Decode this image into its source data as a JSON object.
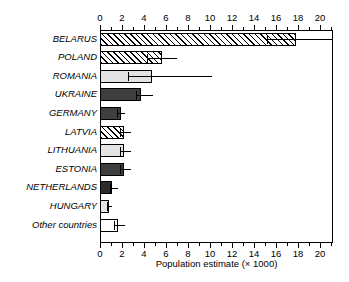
{
  "chart_data": {
    "type": "bar",
    "orientation": "horizontal",
    "title": "",
    "xlabel": "Population estimate (× 1000)",
    "ylabel": "",
    "xlim": [
      0,
      21.2
    ],
    "xticks": [
      0,
      2,
      4,
      6,
      8,
      10,
      12,
      14,
      16,
      18,
      20
    ],
    "xticklabels": [
      "0",
      "2",
      "4",
      "6",
      "8",
      "10",
      "12",
      "14",
      "16",
      "18",
      "20"
    ],
    "minor_tick_step": 1,
    "grid": false,
    "legend": null,
    "axis_top": true,
    "axis_bottom": true,
    "categories": [
      "BELARUS",
      "POLAND",
      "ROMANIA",
      "UKRAINE",
      "GERMANY",
      "LATVIA",
      "LITHUANIA",
      "ESTONIA",
      "NETHERLANDS",
      "HUNGARY",
      "Other countries"
    ],
    "values": [
      17.8,
      5.6,
      4.7,
      3.7,
      1.9,
      2.2,
      2.2,
      2.2,
      1.1,
      0.8,
      1.6
    ],
    "error_low": [
      15.2,
      4.3,
      2.5,
      3.3,
      1.5,
      1.8,
      1.8,
      1.8,
      0.9,
      0.6,
      1.3
    ],
    "error_high": [
      21.2,
      7.0,
      10.2,
      4.8,
      2.3,
      2.8,
      2.8,
      2.8,
      1.6,
      1.1,
      2.3
    ],
    "fills": [
      "hatch",
      "hatch",
      "light-gray",
      "dark-gray",
      "dark-gray",
      "hatch",
      "light-gray",
      "dark-gray",
      "darker-gray",
      "light-gray",
      "white"
    ],
    "colors": {
      "light-gray": "#e3e3e3",
      "dark-gray": "#3e3e3e",
      "darker-gray": "#2b2b2b",
      "white": "#ffffff",
      "outline": "#000000"
    },
    "bars": [
      {
        "category": "BELARUS",
        "value": 17.8,
        "err_low": 15.2,
        "err_high": 21.2,
        "fill": "hatch"
      },
      {
        "category": "POLAND",
        "value": 5.6,
        "err_low": 4.3,
        "err_high": 7.0,
        "fill": "hatch"
      },
      {
        "category": "ROMANIA",
        "value": 4.7,
        "err_low": 2.5,
        "err_high": 10.2,
        "fill": "light-gray"
      },
      {
        "category": "UKRAINE",
        "value": 3.7,
        "err_low": 3.3,
        "err_high": 4.8,
        "fill": "dark-gray"
      },
      {
        "category": "GERMANY",
        "value": 1.9,
        "err_low": 1.5,
        "err_high": 2.3,
        "fill": "dark-gray"
      },
      {
        "category": "LATVIA",
        "value": 2.2,
        "err_low": 1.8,
        "err_high": 2.8,
        "fill": "hatch"
      },
      {
        "category": "LITHUANIA",
        "value": 2.2,
        "err_low": 1.8,
        "err_high": 2.8,
        "fill": "light-gray"
      },
      {
        "category": "ESTONIA",
        "value": 2.2,
        "err_low": 1.8,
        "err_high": 2.8,
        "fill": "dark-gray"
      },
      {
        "category": "NETHERLANDS",
        "value": 1.1,
        "err_low": 0.9,
        "err_high": 1.6,
        "fill": "darker-gray"
      },
      {
        "category": "HUNGARY",
        "value": 0.8,
        "err_low": 0.6,
        "err_high": 1.1,
        "fill": "light-gray"
      },
      {
        "category": "Other countries",
        "value": 1.6,
        "err_low": 1.3,
        "err_high": 2.3,
        "fill": "white"
      }
    ]
  }
}
